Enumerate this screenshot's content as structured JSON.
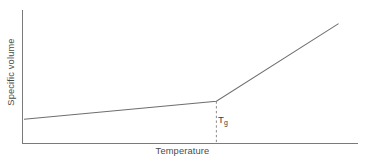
{
  "figure": {
    "background_color": "#ffffff",
    "line_color": "#6e6e6e",
    "axis_color": "#7a7a7a",
    "text_color": "#4a4a4a",
    "width": 365,
    "height": 163
  },
  "labels": {
    "xlabel": "Temperature",
    "ylabel": "Specific volume",
    "annotation_symbol": "T",
    "annotation_subscript": "g"
  },
  "chart_data": {
    "type": "line",
    "title": "",
    "subtitle": "",
    "xlabel": "Temperature",
    "ylabel": "Specific volume",
    "xlim": [
      0,
      1
    ],
    "ylim": [
      0,
      1
    ],
    "grid": false,
    "legend": false,
    "legend_position": "none",
    "xticks": [],
    "yticks": [],
    "xticklabels": [],
    "yticklabels": [],
    "axis_style": "open-left-bottom-spines-only",
    "annotations": [
      {
        "text": "Tg",
        "display": "T_g",
        "meaning": "glass transition temperature",
        "x": 0.595,
        "y": 0.185,
        "marker": "dashed-vertical-line"
      }
    ],
    "series": [
      {
        "name": "specific volume",
        "style": "solid",
        "color": "#6e6e6e",
        "x": [
          0.003,
          0.595,
          0.971
        ],
        "y": [
          0.188,
          0.331,
          0.947
        ],
        "segments": [
          {
            "name": "glassy-region",
            "x": [
              0.003,
              0.595
            ],
            "y": [
              0.188,
              0.331
            ],
            "slope": "shallow"
          },
          {
            "name": "rubbery-liquid-region",
            "x": [
              0.595,
              0.971
            ],
            "y": [
              0.331,
              0.947
            ],
            "slope": "steep"
          }
        ]
      },
      {
        "name": "Tg guide line",
        "style": "dashed",
        "color": "#8a8a8a",
        "x": [
          0.595,
          0.595
        ],
        "y": [
          0.0,
          0.331
        ]
      }
    ]
  }
}
